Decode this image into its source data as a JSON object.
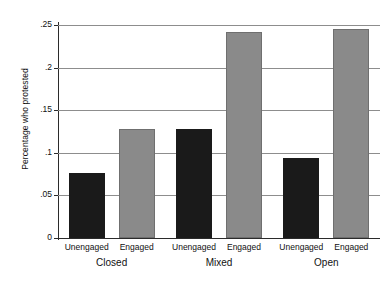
{
  "chart_data": {
    "type": "bar",
    "title": "",
    "xlabel": "",
    "ylabel": "Percentage who protested",
    "ylim": [
      0,
      0.26
    ],
    "yticks": [
      0,
      0.05,
      0.1,
      0.15,
      0.2,
      0.25
    ],
    "ytick_labels": [
      "0",
      ".05",
      ".1",
      ".15",
      ".2",
      ".25"
    ],
    "grid": "horizontal",
    "legend": "none",
    "categories": [
      "Closed",
      "Mixed",
      "Open"
    ],
    "series": [
      {
        "name": "Unengaged",
        "color": "#1a1a1a",
        "values": [
          0.076,
          0.128,
          0.094
        ]
      },
      {
        "name": "Engaged",
        "color": "#8a8a8a",
        "values": [
          0.128,
          0.242,
          0.245
        ]
      }
    ],
    "bars": [
      {
        "group": "Closed",
        "series": "Unengaged",
        "value": 0.076
      },
      {
        "group": "Closed",
        "series": "Engaged",
        "value": 0.128
      },
      {
        "group": "Mixed",
        "series": "Unengaged",
        "value": 0.128
      },
      {
        "group": "Mixed",
        "series": "Engaged",
        "value": 0.242
      },
      {
        "group": "Open",
        "series": "Unengaged",
        "value": 0.094
      },
      {
        "group": "Open",
        "series": "Engaged",
        "value": 0.245
      }
    ]
  },
  "axes": {
    "y_title": "Percentage who protested",
    "y_tick_0": "0",
    "y_tick_1": ".05",
    "y_tick_2": ".1",
    "y_tick_3": ".15",
    "y_tick_4": ".2",
    "y_tick_5": ".25"
  },
  "x_axis": {
    "groups": [
      {
        "label": "Closed",
        "bars": [
          {
            "label": "Unengaged",
            "value": 0.076
          },
          {
            "label": "Engaged",
            "value": 0.128
          }
        ]
      },
      {
        "label": "Mixed",
        "bars": [
          {
            "label": "Unengaged",
            "value": 0.128
          },
          {
            "label": "Engaged",
            "value": 0.242
          }
        ]
      },
      {
        "label": "Open",
        "bars": [
          {
            "label": "Unengaged",
            "value": 0.094
          },
          {
            "label": "Engaged",
            "value": 0.245
          }
        ]
      }
    ]
  }
}
